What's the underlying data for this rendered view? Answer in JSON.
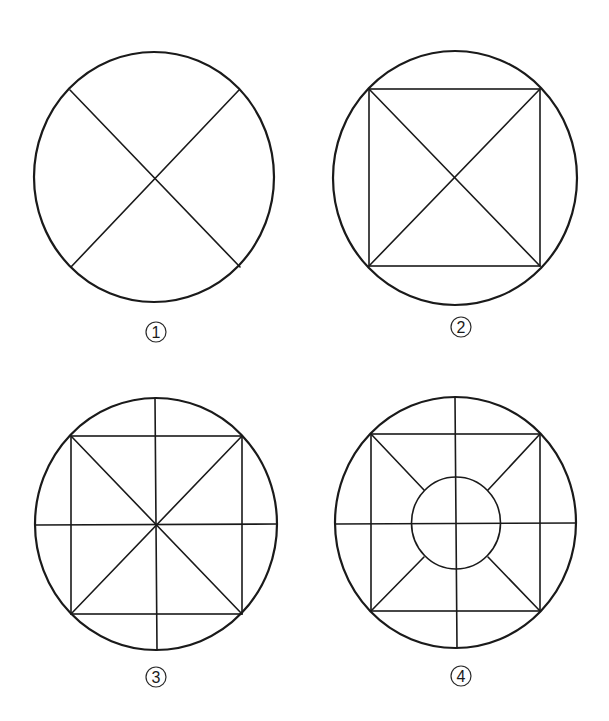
{
  "figure": {
    "width": 609,
    "height": 721,
    "stroke_color": "#1a1a1a",
    "background": "#ffffff"
  },
  "panels": [
    {
      "id": "panel-1",
      "label": "1",
      "label_glyph": "①",
      "label_pos": {
        "x": 156,
        "y": 332
      },
      "outer_circle": {
        "cx": 154,
        "cy": 177,
        "rx": 120,
        "ry": 125
      },
      "square": null,
      "inner_circle": null,
      "lines": [
        {
          "name": "diagonal-tl-br",
          "x1": 70,
          "y1": 90,
          "x2": 240,
          "y2": 267
        },
        {
          "name": "diagonal-tr-bl",
          "x1": 239,
          "y1": 90,
          "x2": 71,
          "y2": 267
        }
      ]
    },
    {
      "id": "panel-2",
      "label": "2",
      "label_glyph": "②",
      "label_pos": {
        "x": 461,
        "y": 327
      },
      "outer_circle": {
        "cx": 455,
        "cy": 178,
        "rx": 122,
        "ry": 127
      },
      "square": {
        "x1": 369,
        "y1": 89,
        "x2": 540,
        "y2": 266
      },
      "inner_circle": null,
      "lines": [
        {
          "name": "diagonal-tl-br",
          "x1": 369,
          "y1": 89,
          "x2": 540,
          "y2": 266
        },
        {
          "name": "diagonal-tr-bl",
          "x1": 540,
          "y1": 89,
          "x2": 369,
          "y2": 266
        }
      ]
    },
    {
      "id": "panel-3",
      "label": "3",
      "label_glyph": "③",
      "label_pos": {
        "x": 156,
        "y": 677
      },
      "outer_circle": {
        "cx": 156,
        "cy": 524,
        "rx": 121,
        "ry": 126
      },
      "square": {
        "x1": 71,
        "y1": 436,
        "x2": 242,
        "y2": 614
      },
      "inner_circle": null,
      "lines": [
        {
          "name": "diagonal-tl-br",
          "x1": 71,
          "y1": 436,
          "x2": 242,
          "y2": 614
        },
        {
          "name": "diagonal-tr-bl",
          "x1": 242,
          "y1": 436,
          "x2": 71,
          "y2": 614
        },
        {
          "name": "vertical-axis",
          "x1": 155,
          "y1": 398,
          "x2": 157,
          "y2": 650
        },
        {
          "name": "horizontal-axis",
          "x1": 35,
          "y1": 525,
          "x2": 277,
          "y2": 524
        }
      ]
    },
    {
      "id": "panel-4",
      "label": "4",
      "label_glyph": "④",
      "label_pos": {
        "x": 461,
        "y": 676
      },
      "outer_circle": {
        "cx": 455.5,
        "cy": 522.5,
        "rx": 120.5,
        "ry": 125.5
      },
      "square": {
        "x1": 371,
        "y1": 434,
        "x2": 540,
        "y2": 611
      },
      "inner_circle": {
        "cx": 456,
        "cy": 523,
        "rx": 44.5,
        "ry": 46
      },
      "lines": [
        {
          "name": "diagonal-tl-inner",
          "x1": 371,
          "y1": 434,
          "x2": 424,
          "y2": 490
        },
        {
          "name": "diagonal-tr-inner",
          "x1": 540,
          "y1": 434,
          "x2": 488,
          "y2": 490
        },
        {
          "name": "diagonal-bl-inner",
          "x1": 371,
          "y1": 611,
          "x2": 424,
          "y2": 557
        },
        {
          "name": "diagonal-br-inner",
          "x1": 540,
          "y1": 611,
          "x2": 488,
          "y2": 557
        },
        {
          "name": "vertical-axis",
          "x1": 455,
          "y1": 397,
          "x2": 457,
          "y2": 648
        },
        {
          "name": "horizontal-axis",
          "x1": 335,
          "y1": 524,
          "x2": 576,
          "y2": 523
        }
      ]
    }
  ]
}
